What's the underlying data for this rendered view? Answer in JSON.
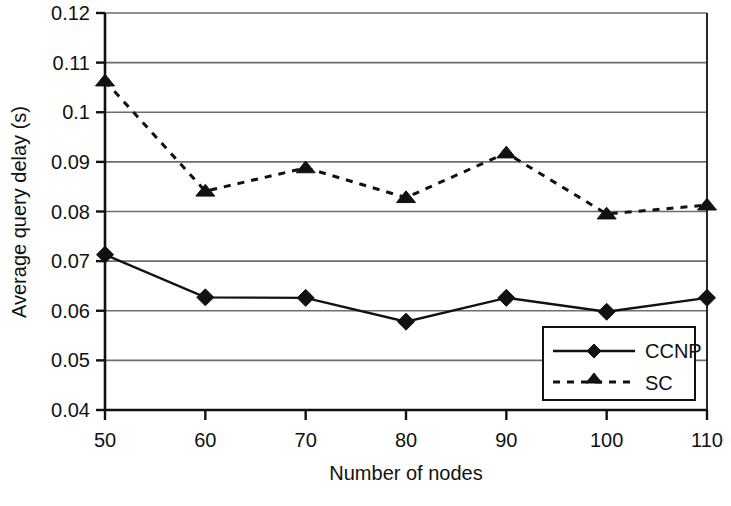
{
  "chart_data": {
    "type": "line",
    "title": "",
    "xlabel": "Number of nodes",
    "ylabel": "Average query delay (s)",
    "x": [
      50,
      60,
      70,
      80,
      90,
      100,
      110
    ],
    "xtick_labels": [
      "50",
      "60",
      "70",
      "80",
      "90",
      "100",
      "110"
    ],
    "ytick_labels": [
      "0.04",
      "0.05",
      "0.06",
      "0.07",
      "0.08",
      "0.09",
      "0.1",
      "0.11",
      "0.12"
    ],
    "ytick_values": [
      0.04,
      0.05,
      0.06,
      0.07,
      0.08,
      0.09,
      0.1,
      0.11,
      0.12
    ],
    "xlim": [
      50,
      110
    ],
    "ylim": [
      0.04,
      0.12
    ],
    "grid": "horizontal",
    "legend_position": "inside-bottom-right",
    "series": [
      {
        "name": "CCNP",
        "marker": "diamond",
        "linestyle": "solid",
        "color": "#111111",
        "values": [
          0.0713,
          0.0627,
          0.0626,
          0.0578,
          0.0626,
          0.0598,
          0.0626
        ]
      },
      {
        "name": "SC",
        "marker": "triangle",
        "linestyle": "dashed",
        "color": "#111111",
        "values": [
          0.1063,
          0.0841,
          0.0888,
          0.0828,
          0.0918,
          0.0795,
          0.0813
        ]
      }
    ]
  },
  "legend": {
    "entries": [
      {
        "label": "CCNP"
      },
      {
        "label": "SC"
      }
    ]
  },
  "axes": {
    "x_title": "Number of nodes",
    "y_title": "Average query delay (s)"
  }
}
